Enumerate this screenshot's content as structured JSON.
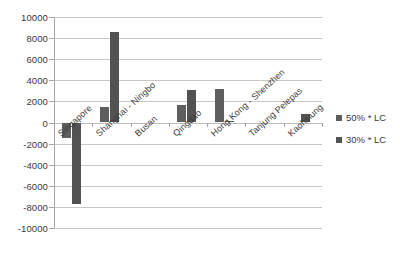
{
  "chart_data": {
    "type": "bar",
    "title": "",
    "subtitle": "",
    "xlabel": "",
    "ylabel": "",
    "ylim": [
      -10000,
      10000
    ],
    "ytick_step": 2000,
    "yticks": [
      "10000",
      "8000",
      "6000",
      "4000",
      "2000",
      "0",
      "-2000",
      "-4000",
      "-6000",
      "-8000",
      "-10000"
    ],
    "ytick_values": [
      10000,
      8000,
      6000,
      4000,
      2000,
      0,
      -2000,
      -4000,
      -6000,
      -8000,
      -10000
    ],
    "grid": "horizontal",
    "legend_position": "right",
    "orientation": "vertical",
    "categories": [
      "Singapore",
      "Shanghai - Ningbo",
      "Busan",
      "Qingdao",
      "Hong Kong - Shenzhen",
      "Tanjung Pelepas",
      "Kaohsiung"
    ],
    "series": [
      {
        "name": "50% * LC",
        "color": "#5e5e5e",
        "values": [
          -1500,
          1500,
          0,
          1700,
          3200,
          0,
          0
        ]
      },
      {
        "name": "30% * LC",
        "color": "#525252",
        "values": [
          -7700,
          8600,
          0,
          3100,
          100,
          0,
          850
        ]
      }
    ]
  },
  "legend": {
    "items": [
      {
        "label": "50% * LC",
        "color": "#5e5e5e"
      },
      {
        "label": "30% * LC",
        "color": "#525252"
      }
    ]
  }
}
